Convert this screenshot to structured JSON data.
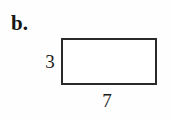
{
  "figure": {
    "part_label": "b.",
    "background_color": "#fefefe",
    "stroke_color": "#2a2a2a",
    "text_color": "#1a1a1a"
  },
  "shape": {
    "kind": "rectangle",
    "height_label": "3",
    "width_label": "7"
  }
}
